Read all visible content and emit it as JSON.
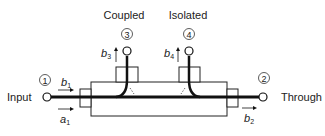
{
  "diagram": {
    "ports": [
      {
        "number": "1",
        "name": "Input",
        "incident_wave": "a",
        "incident_sub": "1",
        "reflected_wave": "b",
        "reflected_sub": "1"
      },
      {
        "number": "2",
        "name": "Through",
        "wave": "b",
        "wave_sub": "2"
      },
      {
        "number": "3",
        "name": "Coupled",
        "wave": "b",
        "wave_sub": "3"
      },
      {
        "number": "4",
        "name": "Isolated",
        "wave": "b",
        "wave_sub": "4"
      }
    ],
    "colors": {
      "line": "#111111",
      "box": "#222222",
      "background": "#ffffff"
    }
  }
}
